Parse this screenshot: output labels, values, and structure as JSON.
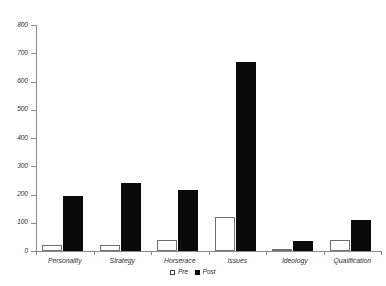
{
  "chart_data": {
    "type": "bar",
    "title": "",
    "subtitle": "",
    "xlabel": "",
    "ylabel": "",
    "ylim": [
      0,
      800
    ],
    "yticks": [
      0,
      100,
      200,
      300,
      400,
      500,
      600,
      700,
      800
    ],
    "grid": false,
    "legend_position": "bottom-center",
    "categories": [
      "Personality",
      "Strategy",
      "Horserace",
      "Issues",
      "Ideology",
      "Qualification"
    ],
    "series": [
      {
        "name": "Pre",
        "color": "#ffffff",
        "edge_color": "#6f6f6f",
        "values": [
          20,
          22,
          40,
          120,
          5,
          40
        ]
      },
      {
        "name": "Post",
        "color": "#0a0a0a",
        "edge_color": "#0a0a0a",
        "values": [
          193,
          240,
          215,
          670,
          37,
          110
        ]
      }
    ]
  },
  "legend": {
    "items": [
      {
        "label": "Pre",
        "swatch": "hollow-square-icon"
      },
      {
        "label": "Post",
        "swatch": "filled-square-icon"
      }
    ]
  },
  "axis": {
    "y_tick_labels": [
      "800",
      "700",
      "600",
      "500",
      "400",
      "300",
      "200",
      "100",
      "0"
    ]
  }
}
